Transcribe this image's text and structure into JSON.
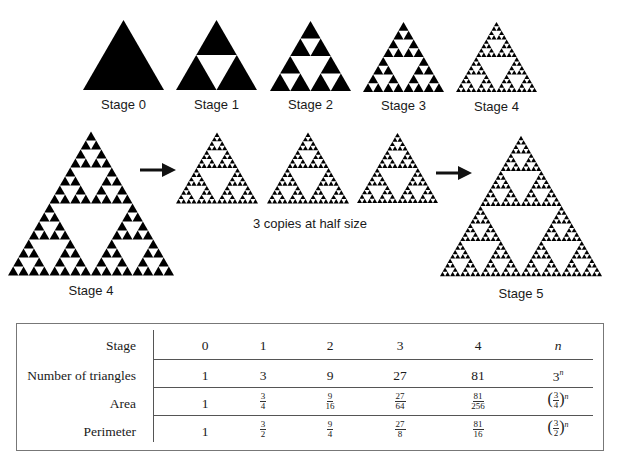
{
  "figure": {
    "top_row": [
      {
        "label": "Stage 0",
        "depth": 0
      },
      {
        "label": "Stage 1",
        "depth": 1
      },
      {
        "label": "Stage 2",
        "depth": 2
      },
      {
        "label": "Stage 3",
        "depth": 3
      },
      {
        "label": "Stage 4",
        "depth": 4
      }
    ],
    "construction": {
      "source_label": "Stage 4",
      "copies_caption": "3 copies at half size",
      "result_label": "Stage 5"
    },
    "colors": {
      "fill": "#000000",
      "background": "#ffffff"
    }
  },
  "table": {
    "header": {
      "label": "Stage",
      "values": [
        "0",
        "1",
        "2",
        "3",
        "4",
        "n"
      ]
    },
    "rows": [
      {
        "label": "Number of triangles",
        "values": [
          "1",
          "3",
          "9",
          "27",
          "81",
          "3^n"
        ]
      },
      {
        "label": "Area",
        "values": [
          "1",
          "3/4",
          "9/16",
          "27/64",
          "81/256",
          "(3/4)^n"
        ]
      },
      {
        "label": "Perimeter",
        "values": [
          "1",
          "3/2",
          "9/4",
          "27/8",
          "81/16",
          "(3/2)^n"
        ]
      }
    ],
    "fractions": {
      "area": [
        [
          "3",
          "4"
        ],
        [
          "9",
          "16"
        ],
        [
          "27",
          "64"
        ],
        [
          "81",
          "256"
        ]
      ],
      "perimeter": [
        [
          "3",
          "2"
        ],
        [
          "9",
          "4"
        ],
        [
          "27",
          "8"
        ],
        [
          "81",
          "16"
        ]
      ],
      "area_general": [
        "3",
        "4"
      ],
      "perimeter_general": [
        "3",
        "2"
      ],
      "exponent": "n",
      "triangles_general_base": "3"
    }
  }
}
